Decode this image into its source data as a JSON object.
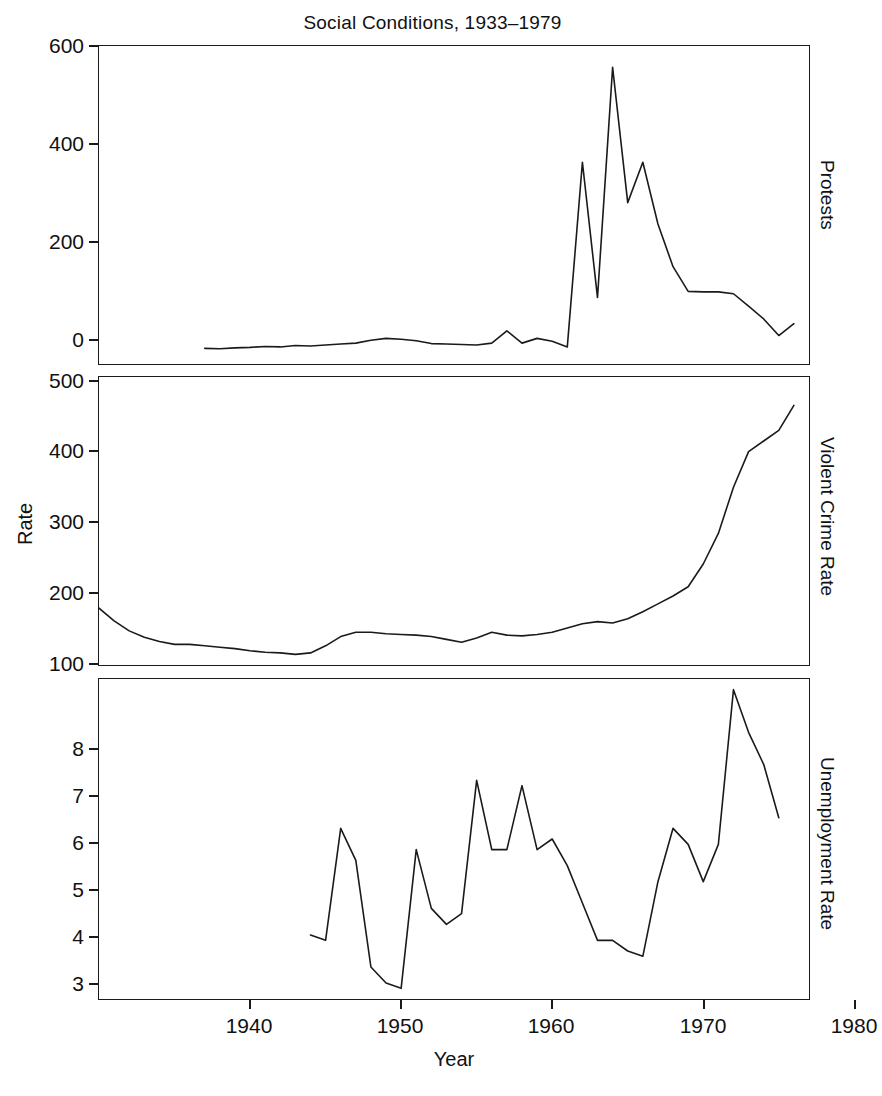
{
  "chart_data": {
    "type": "line",
    "title": "Social Conditions, 1933–1979",
    "xlabel": "Year",
    "ylabel": "Rate",
    "grid": false,
    "legend": "none",
    "layout": "3 stacked panels sharing a common Year x-axis, strip labels on right",
    "xlim": [
      1933,
      1980
    ],
    "xticks": [
      1940,
      1950,
      1960,
      1970,
      1980
    ],
    "xtick_labels": [
      "1940",
      "1950",
      "1960",
      "1970",
      "1980"
    ],
    "panels": [
      {
        "strip_label": "Protests",
        "ylim": [
          -30,
          640
        ],
        "yticks": [
          0,
          200,
          400,
          600
        ],
        "ytick_labels": [
          "0",
          "200",
          "400",
          "600"
        ],
        "x": [
          1940,
          1941,
          1942,
          1943,
          1944,
          1945,
          1946,
          1947,
          1948,
          1949,
          1950,
          1951,
          1952,
          1953,
          1954,
          1955,
          1956,
          1957,
          1958,
          1959,
          1960,
          1961,
          1962,
          1963,
          1964,
          1965,
          1966,
          1967,
          1968,
          1969,
          1970,
          1971,
          1972,
          1973,
          1974,
          1975,
          1976,
          1977,
          1978,
          1979
        ],
        "y": [
          3,
          2,
          4,
          5,
          7,
          6,
          9,
          8,
          10,
          12,
          14,
          20,
          24,
          22,
          19,
          13,
          12,
          11,
          10,
          14,
          40,
          14,
          24,
          18,
          6,
          395,
          110,
          595,
          310,
          395,
          265,
          175,
          123,
          122,
          122,
          118,
          92,
          65,
          30,
          55,
          22,
          18
        ]
      },
      {
        "strip_label": "Violent Crime Rate",
        "ylim": [
          95,
          500
        ],
        "yticks": [
          100,
          200,
          300,
          400,
          500
        ],
        "ytick_labels": [
          "100",
          "200",
          "300",
          "400",
          "500"
        ],
        "x": [
          1933,
          1934,
          1935,
          1936,
          1937,
          1938,
          1939,
          1940,
          1941,
          1942,
          1943,
          1944,
          1945,
          1946,
          1947,
          1948,
          1949,
          1950,
          1951,
          1952,
          1953,
          1954,
          1955,
          1956,
          1957,
          1958,
          1959,
          1960,
          1961,
          1962,
          1963,
          1964,
          1965,
          1966,
          1967,
          1968,
          1969,
          1970,
          1971,
          1972,
          1973,
          1974,
          1975,
          1976,
          1977,
          1978,
          1979
        ],
        "y": [
          175,
          157,
          143,
          134,
          128,
          124,
          124,
          122,
          120,
          118,
          115,
          113,
          112,
          110,
          112,
          122,
          135,
          141,
          141,
          139,
          138,
          137,
          135,
          131,
          127,
          133,
          141,
          137,
          136,
          138,
          141,
          147,
          153,
          156,
          154,
          160,
          170,
          181,
          192,
          205,
          237,
          280,
          345,
          395,
          410,
          425,
          460,
          477,
          461,
          468,
          480
        ]
      },
      {
        "strip_label": "Unemployment Rate",
        "ylim": [
          2.7,
          8.7
        ],
        "yticks": [
          3,
          4,
          5,
          6,
          7,
          8
        ],
        "ytick_labels": [
          "3",
          "4",
          "5",
          "6",
          "7",
          "8"
        ],
        "x": [
          1947,
          1948,
          1949,
          1950,
          1951,
          1952,
          1953,
          1954,
          1955,
          1956,
          1957,
          1958,
          1959,
          1960,
          1961,
          1962,
          1963,
          1964,
          1965,
          1966,
          1967,
          1968,
          1969,
          1970,
          1971,
          1972,
          1973,
          1974,
          1975,
          1976,
          1977,
          1978
        ],
        "y": [
          3.9,
          3.8,
          5.9,
          5.3,
          3.3,
          3.0,
          2.9,
          5.5,
          4.4,
          4.1,
          4.3,
          6.8,
          5.5,
          5.5,
          6.7,
          5.5,
          5.7,
          5.2,
          4.5,
          3.8,
          3.8,
          3.6,
          3.5,
          4.9,
          5.9,
          5.6,
          4.9,
          5.6,
          8.5,
          7.7,
          7.1,
          6.1
        ]
      }
    ]
  },
  "title": {
    "text": "Social Conditions, 1933–1979"
  },
  "axes": {
    "y_label": "Rate",
    "x_label": "Year",
    "x_tick_labels": [
      "1940",
      "1950",
      "1960",
      "1970",
      "1980"
    ]
  },
  "panel1": {
    "strip": "Protests",
    "y_tick_labels": [
      "600",
      "400",
      "200",
      "0"
    ]
  },
  "panel2": {
    "strip": "Violent Crime Rate",
    "y_tick_labels": [
      "500",
      "400",
      "300",
      "200",
      "100"
    ]
  },
  "panel3": {
    "strip": "Unemployment Rate",
    "y_tick_labels": [
      "8",
      "7",
      "6",
      "5",
      "4",
      "3"
    ]
  }
}
